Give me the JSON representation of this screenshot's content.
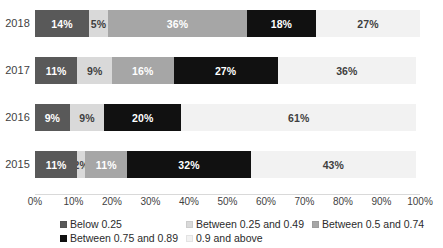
{
  "chart_data": {
    "type": "bar",
    "orientation": "horizontal",
    "stacked": true,
    "title": "",
    "subtitle": "",
    "xlabel": "",
    "ylabel": "",
    "xlim": [
      0,
      100
    ],
    "grid": false,
    "legend_position": "bottom",
    "categories": [
      "2018",
      "2017",
      "2016",
      "2015"
    ],
    "tick_labels": [
      "0%",
      "10%",
      "20%",
      "30%",
      "40%",
      "50%",
      "60%",
      "70%",
      "80%",
      "90%",
      "100%"
    ],
    "tick_values": [
      0,
      10,
      20,
      30,
      40,
      50,
      60,
      70,
      80,
      90,
      100
    ],
    "series": [
      {
        "name": "Below 0.25",
        "color": "#595959",
        "text_color": "#ffffff",
        "values": [
          14,
          11,
          9,
          11
        ],
        "labels": [
          "14%",
          "11%",
          "9%",
          "11%"
        ]
      },
      {
        "name": "Between 0.25 and 0.49",
        "color": "#d9d9d9",
        "text_color": "#3f3f3f",
        "values": [
          5,
          9,
          9,
          2
        ],
        "labels": [
          "5%",
          "9%",
          "9%",
          "2%"
        ]
      },
      {
        "name": "Between 0.5 and 0.74",
        "color": "#a6a6a6",
        "text_color": "#ffffff",
        "values": [
          36,
          16,
          0,
          11
        ],
        "labels": [
          "36%",
          "16%",
          "",
          "11%"
        ]
      },
      {
        "name": "Between 0.75 and 0.89",
        "color": "#111111",
        "text_color": "#ffffff",
        "values": [
          18,
          27,
          20,
          32
        ],
        "labels": [
          "18%",
          "27%",
          "20%",
          "32%"
        ]
      },
      {
        "name": "0.9 and above",
        "color": "#f2f2f2",
        "text_color": "#3f3f3f",
        "values": [
          27,
          36,
          61,
          43
        ],
        "labels": [
          "27%",
          "36%",
          "61%",
          "43%"
        ]
      }
    ]
  },
  "legend": {
    "items": [
      {
        "label": "Below 0.25",
        "color": "#595959"
      },
      {
        "label": "Between 0.25 and 0.49",
        "color": "#d9d9d9"
      },
      {
        "label": "Between 0.5 and 0.74",
        "color": "#a6a6a6"
      },
      {
        "label": "Between 0.75 and 0.89",
        "color": "#111111"
      },
      {
        "label": "0.9 and above",
        "color": "#f2f2f2"
      }
    ]
  }
}
